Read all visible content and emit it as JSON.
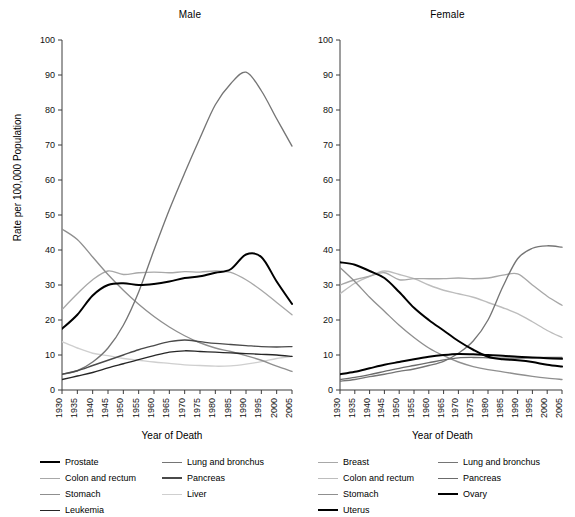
{
  "figure": {
    "ylabel": "Rate per 100,000 Population",
    "xlabel_male": "Year of Death",
    "xlabel_female": "Year of Death",
    "title_male": "Male",
    "title_female": "Female"
  },
  "axes": {
    "yticks": [
      "100",
      "90",
      "80",
      "70",
      "60",
      "50",
      "40",
      "30",
      "20",
      "10",
      "0"
    ],
    "xticks": [
      "1930",
      "1935",
      "1940",
      "1945",
      "1950",
      "1955",
      "1960",
      "1965",
      "1970",
      "1975",
      "1980",
      "1985",
      "1990",
      "1995",
      "2000",
      "2005"
    ],
    "ylim": [
      0,
      100
    ],
    "xlim": [
      1930,
      2005
    ],
    "grid": false
  },
  "colors": {
    "black": "#000000",
    "dark_gray": "#4a4a4a",
    "mid_gray": "#757575",
    "gray": "#8f8f8f",
    "light_gray": "#a8a8a8",
    "lighter_gray": "#bdbdbd",
    "very_light_gray": "#cfcfcf"
  },
  "legend_male": {
    "left": [
      {
        "label": "Prostate",
        "color": "#000000",
        "width": 2.2
      },
      {
        "label": "Colon and rectum",
        "color": "#a8a8a8",
        "width": 1.5
      },
      {
        "label": "Stomach",
        "color": "#8f8f8f",
        "width": 1.5
      },
      {
        "label": "Leukemia",
        "color": "#262626",
        "width": 1.8
      }
    ],
    "right": [
      {
        "label": "Lung and bronchus",
        "color": "#757575",
        "width": 1.6
      },
      {
        "label": "Pancreas",
        "color": "#4a4a4a",
        "width": 2.0
      },
      {
        "label": "Liver",
        "color": "#cfcfcf",
        "width": 1.5
      }
    ]
  },
  "legend_female": {
    "left": [
      {
        "label": "Breast",
        "color": "#a8a8a8",
        "width": 1.6
      },
      {
        "label": "Colon and rectum",
        "color": "#bdbdbd",
        "width": 1.6
      },
      {
        "label": "Stomach",
        "color": "#8f8f8f",
        "width": 1.6
      },
      {
        "label": "Uterus",
        "color": "#000000",
        "width": 2.2
      }
    ],
    "right": [
      {
        "label": "Lung and bronchus",
        "color": "#757575",
        "width": 1.7
      },
      {
        "label": "Pancreas",
        "color": "#6b6b6b",
        "width": 1.7
      },
      {
        "label": "Ovary",
        "color": "#000000",
        "width": 2.0
      }
    ]
  },
  "chart_data": [
    {
      "type": "line",
      "title": "Male",
      "xlabel": "Year of Death",
      "ylabel": "Rate per 100,000 Population",
      "xlim": [
        1930,
        2005
      ],
      "ylim": [
        0,
        100
      ],
      "grid": false,
      "legend_position": "below",
      "x": [
        1930,
        1935,
        1940,
        1945,
        1950,
        1955,
        1960,
        1965,
        1970,
        1975,
        1980,
        1985,
        1990,
        1995,
        2000,
        2005
      ],
      "series": [
        {
          "name": "Lung and bronchus",
          "color": "#757575",
          "values": [
            4.5,
            5.5,
            8.0,
            12.0,
            18.5,
            28.0,
            40.0,
            51.5,
            62.0,
            72.0,
            81.5,
            87.5,
            90.8,
            85.5,
            77.5,
            69.7
          ]
        },
        {
          "name": "Stomach",
          "color": "#8f8f8f",
          "values": [
            46.0,
            43.0,
            38.0,
            33.0,
            28.5,
            24.5,
            21.0,
            18.0,
            15.5,
            13.5,
            12.0,
            11.0,
            9.8,
            8.5,
            6.8,
            5.3
          ]
        },
        {
          "name": "Prostate",
          "color": "#000000",
          "values": [
            17.5,
            21.5,
            27.0,
            30.0,
            30.5,
            30.0,
            30.3,
            31.0,
            32.0,
            32.5,
            33.5,
            34.5,
            38.7,
            38.0,
            31.0,
            24.6
          ]
        },
        {
          "name": "Colon and rectum",
          "color": "#a8a8a8",
          "values": [
            23.0,
            27.5,
            31.5,
            34.0,
            33.0,
            33.5,
            33.7,
            33.5,
            33.8,
            33.7,
            34.0,
            33.6,
            31.5,
            28.5,
            25.0,
            21.5
          ]
        },
        {
          "name": "Pancreas",
          "color": "#4a4a4a",
          "values": [
            4.5,
            5.5,
            7.0,
            8.5,
            10.0,
            11.5,
            12.7,
            13.8,
            14.3,
            13.8,
            13.3,
            13.0,
            12.7,
            12.4,
            12.3,
            12.4
          ]
        },
        {
          "name": "Leukemia",
          "color": "#262626",
          "values": [
            3.0,
            4.0,
            5.0,
            6.3,
            7.5,
            8.7,
            9.8,
            10.8,
            11.2,
            11.0,
            10.8,
            10.6,
            10.4,
            10.2,
            10.0,
            9.6
          ]
        },
        {
          "name": "Liver",
          "color": "#cfcfcf",
          "values": [
            13.8,
            12.0,
            10.5,
            9.8,
            9.0,
            8.5,
            8.0,
            7.6,
            7.2,
            7.0,
            6.8,
            6.9,
            7.4,
            8.1,
            9.0,
            9.6
          ]
        }
      ]
    },
    {
      "type": "line",
      "title": "Female",
      "xlabel": "Year of Death",
      "ylabel": "Rate per 100,000 Population",
      "xlim": [
        1930,
        2005
      ],
      "ylim": [
        0,
        100
      ],
      "grid": false,
      "legend_position": "below",
      "x": [
        1930,
        1935,
        1940,
        1945,
        1950,
        1955,
        1960,
        1965,
        1970,
        1975,
        1980,
        1985,
        1990,
        1995,
        2000,
        2005
      ],
      "series": [
        {
          "name": "Uterus",
          "color": "#000000",
          "values": [
            36.5,
            35.8,
            34.0,
            32.0,
            28.0,
            23.5,
            20.0,
            17.0,
            14.0,
            11.5,
            9.5,
            8.8,
            8.5,
            8.0,
            7.2,
            6.7
          ]
        },
        {
          "name": "Stomach",
          "color": "#8f8f8f",
          "values": [
            35.0,
            31.0,
            26.5,
            22.5,
            18.5,
            15.0,
            12.0,
            9.8,
            8.0,
            6.7,
            5.8,
            5.2,
            4.5,
            3.9,
            3.4,
            3.0
          ]
        },
        {
          "name": "Breast",
          "color": "#a8a8a8",
          "values": [
            30.0,
            31.5,
            32.5,
            33.5,
            31.5,
            31.8,
            31.8,
            31.8,
            32.0,
            31.8,
            32.0,
            32.8,
            33.2,
            30.0,
            26.8,
            24.2
          ]
        },
        {
          "name": "Colon and rectum",
          "color": "#bdbdbd",
          "values": [
            27.5,
            30.5,
            32.5,
            34.0,
            33.0,
            31.8,
            30.0,
            28.5,
            27.5,
            26.5,
            25.0,
            23.5,
            21.8,
            19.5,
            17.0,
            15.0
          ]
        },
        {
          "name": "Lung and bronchus",
          "color": "#757575",
          "values": [
            2.5,
            3.0,
            3.8,
            4.5,
            5.3,
            6.0,
            7.0,
            8.2,
            10.5,
            14.0,
            20.0,
            29.5,
            37.5,
            40.5,
            41.2,
            40.8
          ]
        },
        {
          "name": "Ovary",
          "color": "#000000",
          "values": [
            4.5,
            5.2,
            6.2,
            7.2,
            8.0,
            8.8,
            9.5,
            10.0,
            10.3,
            10.2,
            10.0,
            9.8,
            9.5,
            9.3,
            9.1,
            8.9
          ]
        },
        {
          "name": "Pancreas",
          "color": "#6b6b6b",
          "values": [
            3.0,
            3.6,
            4.4,
            5.3,
            6.2,
            7.0,
            7.8,
            8.6,
            9.2,
            9.3,
            9.2,
            9.1,
            9.1,
            9.2,
            9.3,
            9.3
          ]
        }
      ]
    }
  ]
}
